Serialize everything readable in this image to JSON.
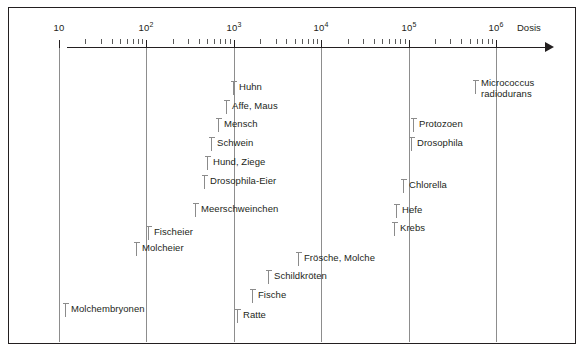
{
  "figure": {
    "axis_title": "Dosis",
    "axis_type": "log",
    "decades": [
      {
        "label": "10",
        "exp": null,
        "value": 10
      },
      {
        "label": "10",
        "exp": "2",
        "value": 100
      },
      {
        "label": "10",
        "exp": "3",
        "value": 1000
      },
      {
        "label": "10",
        "exp": "4",
        "value": 10000
      },
      {
        "label": "10",
        "exp": "5",
        "value": 100000
      },
      {
        "label": "10",
        "exp": "6",
        "value": 1000000
      }
    ]
  },
  "chart_data": {
    "type": "scatter",
    "title": "",
    "xlabel": "Dosis",
    "ylabel": "",
    "xscale": "log",
    "xlim": [
      10,
      1000000
    ],
    "grid": true,
    "legend": "none",
    "tick_labels": [
      "10",
      "10^2",
      "10^3",
      "10^4",
      "10^5",
      "10^6"
    ],
    "categories": [
      "Huhn",
      "Affe, Maus",
      "Mensch",
      "Schwein",
      "Hund, Ziege",
      "Drosophila-Eier",
      "Meerschweinchen",
      "Fischeier",
      "Molcheier",
      "Molchembryonen",
      "Frösche, Molche",
      "Schildkröten",
      "Fische",
      "Ratte",
      "Micrococcus radiodurans",
      "Protozoen",
      "Drosophila",
      "Chlorella",
      "Hefe",
      "Krebs"
    ],
    "points": [
      {
        "label": "Huhn",
        "x": 900,
        "row": 0
      },
      {
        "label": "Affe, Maus",
        "x": 800,
        "row": 1
      },
      {
        "label": "Mensch",
        "x": 600,
        "row": 2
      },
      {
        "label": "Schwein",
        "x": 480,
        "row": 3
      },
      {
        "label": "Hund, Ziege",
        "x": 440,
        "row": 4
      },
      {
        "label": "Drosophila-Eier",
        "x": 400,
        "row": 5
      },
      {
        "label": "Meerschweinchen",
        "x": 290,
        "row": 6
      },
      {
        "label": "Fischeier",
        "x": 85,
        "row": 7
      },
      {
        "label": "Molcheier",
        "x": 62,
        "row": 8
      },
      {
        "label": "Molchembryonen",
        "x": 11,
        "row": 12
      },
      {
        "label": "Frösche, Molche",
        "x": 2700,
        "row": 9
      },
      {
        "label": "Schildkröten",
        "x": 1700,
        "row": 10
      },
      {
        "label": "Fische",
        "x": 1150,
        "row": 11
      },
      {
        "label": "Ratte",
        "x": 800,
        "row": 13
      },
      {
        "label": "Micrococcus radiodurans",
        "x": 330000,
        "row": 0
      },
      {
        "label": "Protozoen",
        "x": 110000,
        "row": 2
      },
      {
        "label": "Drosophila",
        "x": 105000,
        "row": 3
      },
      {
        "label": "Chlorella",
        "x": 82000,
        "row": 5
      },
      {
        "label": "Hefe",
        "x": 70000,
        "row": 6
      },
      {
        "label": "Krebs",
        "x": 68000,
        "row": 7
      }
    ]
  },
  "entries": [
    {
      "name": "huhn",
      "label": "Huhn",
      "left": 224,
      "top": 73
    },
    {
      "name": "affe-maus",
      "label": "Affe, Maus",
      "left": 217,
      "top": 92
    },
    {
      "name": "mensch",
      "label": "Mensch",
      "left": 209,
      "top": 110
    },
    {
      "name": "schwein",
      "label": "Schwein",
      "left": 202,
      "top": 129
    },
    {
      "name": "hund-ziege",
      "label": "Hund, Ziege",
      "left": 198,
      "top": 148
    },
    {
      "name": "drosophila-eier",
      "label": "Drosophila-Eier",
      "left": 195,
      "top": 167
    },
    {
      "name": "meerschweinchen",
      "label": "Meerschweinchen",
      "left": 186,
      "top": 195
    },
    {
      "name": "fischeier",
      "label": "Fischeier",
      "left": 139,
      "top": 218
    },
    {
      "name": "molcheier",
      "label": "Molcheier",
      "left": 127,
      "top": 234
    },
    {
      "name": "froesche-molche",
      "label": "Frösche, Molche",
      "left": 289,
      "top": 244
    },
    {
      "name": "schildkroeten",
      "label": "Schildkröten",
      "left": 259,
      "top": 262
    },
    {
      "name": "fische",
      "label": "Fische",
      "left": 243,
      "top": 281
    },
    {
      "name": "ratte",
      "label": "Ratte",
      "left": 228,
      "top": 301
    },
    {
      "name": "molchembryonen",
      "label": "Molchembryonen",
      "left": 56,
      "top": 295
    },
    {
      "name": "protozoen",
      "label": "Protozoen",
      "left": 404,
      "top": 110
    },
    {
      "name": "drosophila",
      "label": "Drosophila",
      "left": 402,
      "top": 129
    },
    {
      "name": "chlorella",
      "label": "Chlorella",
      "left": 394,
      "top": 171
    },
    {
      "name": "hefe",
      "label": "Hefe",
      "left": 387,
      "top": 196
    },
    {
      "name": "krebs",
      "label": "Krebs",
      "left": 385,
      "top": 214
    }
  ],
  "multiline_entries": [
    {
      "name": "micrococcus-radiodurans",
      "line1": "Micrococcus",
      "line2": "radiodurans",
      "left": 466,
      "top": 72
    }
  ]
}
